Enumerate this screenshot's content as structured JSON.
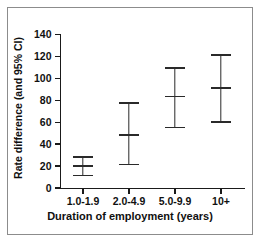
{
  "chart_data": {
    "type": "scatter",
    "title": "",
    "xlabel": "Duration of employment (years)",
    "ylabel": "Rate difference (and 95% CI)",
    "categories": [
      "1.0-1.9",
      "2.0-4.9",
      "5.0-9.9",
      "10+"
    ],
    "values": [
      21,
      49,
      84,
      92
    ],
    "error_low": [
      12,
      22,
      56,
      61
    ],
    "error_high": [
      29,
      78,
      110,
      122
    ],
    "ylim": [
      0,
      140
    ],
    "yticks": [
      0,
      20,
      40,
      60,
      80,
      100,
      120,
      140
    ],
    "ytick_labels": [
      "0",
      "20",
      "40",
      "60",
      "80",
      "100",
      "120",
      "140"
    ],
    "grid": false,
    "legend": false,
    "series": [
      {
        "name": "Rate difference (and 95% CI)",
        "points": [
          {
            "category": "1.0-1.9",
            "value": 21,
            "ci_low": 12,
            "ci_high": 29
          },
          {
            "category": "2.0-4.9",
            "value": 49,
            "ci_low": 22,
            "ci_high": 78
          },
          {
            "category": "5.0-9.9",
            "value": 84,
            "ci_low": 56,
            "ci_high": 110
          },
          {
            "category": "10+",
            "value": 92,
            "ci_low": 61,
            "ci_high": 122
          }
        ]
      }
    ],
    "colors": {
      "axis": "#1a1a1a",
      "marker": "#2a2a2a",
      "frame_border": "#8c8c8c",
      "background": "#ffffff"
    }
  }
}
